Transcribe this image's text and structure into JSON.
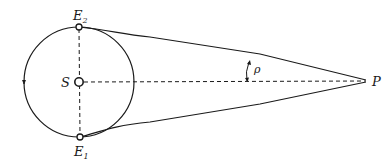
{
  "diagram": {
    "labels": {
      "sun": "S",
      "earth_top": "E",
      "earth_top_sub": "2",
      "earth_bottom": "E",
      "earth_bottom_sub": "1",
      "point": "P",
      "angle": "ρ"
    },
    "colors": {
      "line": "#1a1a1a",
      "background": "#ffffff"
    }
  }
}
